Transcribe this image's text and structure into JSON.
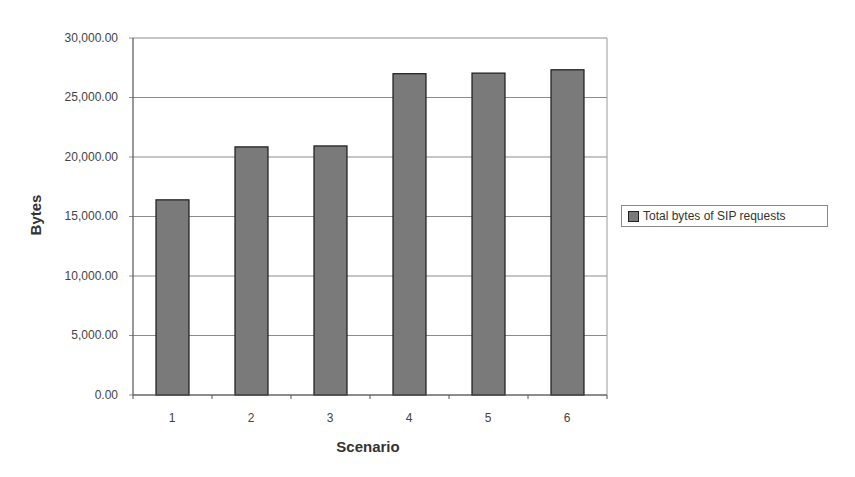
{
  "chart_data": {
    "type": "bar",
    "title": "",
    "xlabel": "Scenario",
    "ylabel": "Bytes",
    "categories": [
      "1",
      "2",
      "3",
      "4",
      "5",
      "6"
    ],
    "series": [
      {
        "name": "Total bytes of SIP requests",
        "values": [
          16400,
          20850,
          20930,
          27000,
          27050,
          27330
        ],
        "color": "#7a7a7a"
      }
    ],
    "ylim": [
      0,
      30000
    ],
    "yticks": [
      0,
      5000,
      10000,
      15000,
      20000,
      25000,
      30000
    ],
    "ytick_labels": [
      "0.00",
      "5,000.00",
      "10,000.00",
      "15,000.00",
      "20,000.00",
      "25,000.00",
      "30,000.00"
    ],
    "grid": true,
    "legend_position": "right"
  },
  "axis": {
    "xlabel": "Scenario",
    "ylabel": "Bytes",
    "yticks": [
      "30,000.00",
      "25,000.00",
      "20,000.00",
      "15,000.00",
      "10,000.00",
      "5,000.00",
      "0.00"
    ],
    "xticks": [
      "1",
      "2",
      "3",
      "4",
      "5",
      "6"
    ]
  },
  "legend": {
    "label": "Total bytes of SIP requests",
    "swatch_color": "#7a7a7a"
  }
}
